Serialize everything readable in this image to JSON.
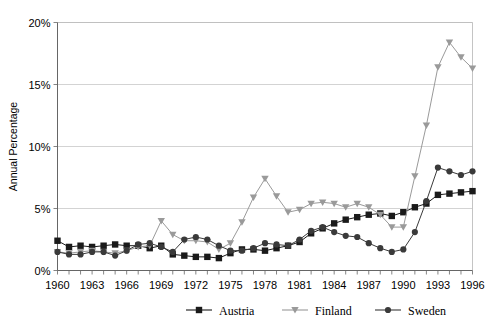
{
  "chart_data": {
    "type": "line",
    "title": "",
    "xlabel": "",
    "ylabel": "Annual Percentage",
    "xlim": [
      1960,
      1996
    ],
    "ylim": [
      0,
      20
    ],
    "yticks": [
      0,
      5,
      10,
      15,
      20
    ],
    "ytick_labels": [
      "0%",
      "5%",
      "10%",
      "15%",
      "20%"
    ],
    "xticks": [
      1960,
      1963,
      1966,
      1969,
      1972,
      1975,
      1978,
      1981,
      1984,
      1987,
      1990,
      1993,
      1996
    ],
    "xtick_labels": [
      "1960",
      "1963",
      "1966",
      "1969",
      "1972",
      "1975",
      "1978",
      "1981",
      "1984",
      "1987",
      "1990",
      "1993",
      "1996"
    ],
    "x": [
      1960,
      1961,
      1962,
      1963,
      1964,
      1965,
      1966,
      1967,
      1968,
      1969,
      1970,
      1971,
      1972,
      1973,
      1974,
      1975,
      1976,
      1977,
      1978,
      1979,
      1980,
      1981,
      1982,
      1983,
      1984,
      1985,
      1986,
      1987,
      1988,
      1989,
      1990,
      1991,
      1992,
      1993,
      1994,
      1995,
      1996
    ],
    "grid": true,
    "legend_position": "bottom",
    "series": [
      {
        "name": "Austria",
        "color": "#1a1a1a",
        "marker": "square",
        "values": [
          2.4,
          1.9,
          2.0,
          1.9,
          2.0,
          2.1,
          2.0,
          2.0,
          1.8,
          2.0,
          1.3,
          1.2,
          1.1,
          1.1,
          1.0,
          1.4,
          1.7,
          1.7,
          1.6,
          1.8,
          2.0,
          2.3,
          3.0,
          3.4,
          3.8,
          4.1,
          4.3,
          4.5,
          4.6,
          4.4,
          4.7,
          5.1,
          5.4,
          6.1,
          6.2,
          6.3,
          6.4
        ]
      },
      {
        "name": "Finland",
        "color": "#9a9a9a",
        "marker": "triangle-down",
        "values": [
          1.5,
          1.4,
          1.5,
          1.6,
          1.5,
          1.4,
          1.6,
          1.9,
          2.0,
          4.0,
          2.9,
          2.4,
          2.4,
          2.3,
          1.7,
          2.2,
          3.9,
          5.9,
          7.4,
          6.0,
          4.7,
          4.9,
          5.4,
          5.5,
          5.4,
          5.1,
          5.4,
          5.1,
          4.5,
          3.5,
          3.5,
          7.6,
          11.7,
          16.4,
          18.4,
          17.2,
          16.3
        ]
      },
      {
        "name": "Sweden",
        "color": "#3a3a3a",
        "marker": "circle",
        "values": [
          1.5,
          1.3,
          1.3,
          1.5,
          1.5,
          1.2,
          1.6,
          2.1,
          2.2,
          1.9,
          1.5,
          2.5,
          2.7,
          2.5,
          2.0,
          1.6,
          1.6,
          1.8,
          2.2,
          2.1,
          2.0,
          2.5,
          3.2,
          3.5,
          3.1,
          2.8,
          2.7,
          2.2,
          1.8,
          1.5,
          1.7,
          3.1,
          5.6,
          8.3,
          8.0,
          7.7,
          8.0
        ]
      }
    ]
  },
  "legend": {
    "items": [
      {
        "label": "Austria"
      },
      {
        "label": "Finland"
      },
      {
        "label": "Sweden"
      }
    ]
  }
}
